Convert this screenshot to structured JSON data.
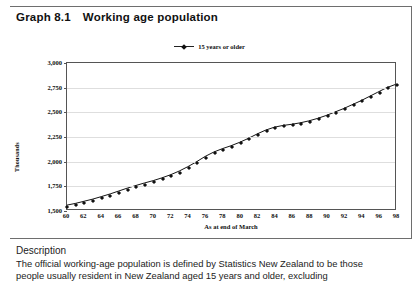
{
  "document": {
    "title_number": "Graph 8.1",
    "title_text": "Working age population"
  },
  "legend": {
    "series_label": "15 years or older",
    "marker_icon": "line-marker-icon"
  },
  "axes": {
    "ylabel": "Thousands",
    "xlabel": "As at end of March"
  },
  "description": {
    "heading": "Description",
    "line1": "The official working-age population is defined by Statistics New Zealand to be those",
    "line2": "people usually resident in New Zealand aged 15 years and older, excluding"
  },
  "colors": {
    "line": "#111111",
    "grid": "#dedede",
    "frame": "#555555",
    "rule": "#6e6e6e",
    "text": "#1a1a1a"
  },
  "chart_data": {
    "type": "line",
    "title": "Working age population",
    "xlabel": "As at end of March",
    "ylabel": "Thousands",
    "ylim": [
      1500,
      3000
    ],
    "yticks": [
      "1,500",
      "1,750",
      "2,000",
      "2,250",
      "2,500",
      "2,750",
      "3,000"
    ],
    "ytick_values": [
      1500,
      1750,
      2000,
      2250,
      2500,
      2750,
      3000
    ],
    "xlim": [
      60,
      98
    ],
    "xticks": [
      "60",
      "62",
      "64",
      "66",
      "68",
      "70",
      "72",
      "74",
      "76",
      "78",
      "80",
      "82",
      "84",
      "86",
      "88",
      "90",
      "92",
      "94",
      "96",
      "98"
    ],
    "xtick_values": [
      60,
      62,
      64,
      66,
      68,
      70,
      72,
      74,
      76,
      78,
      80,
      82,
      84,
      86,
      88,
      90,
      92,
      94,
      96,
      98
    ],
    "grid": true,
    "legend_position": "top-center",
    "series": [
      {
        "name": "15 years or older",
        "x": [
          60,
          61,
          62,
          63,
          64,
          65,
          66,
          67,
          68,
          69,
          70,
          71,
          72,
          73,
          74,
          75,
          76,
          77,
          78,
          79,
          80,
          81,
          82,
          83,
          84,
          85,
          86,
          87,
          88,
          89,
          90,
          91,
          92,
          93,
          94,
          95,
          96,
          97,
          98
        ],
        "values": [
          1540,
          1558,
          1580,
          1602,
          1628,
          1655,
          1685,
          1715,
          1742,
          1768,
          1792,
          1820,
          1852,
          1890,
          1935,
          1985,
          2040,
          2085,
          2120,
          2150,
          2185,
          2225,
          2270,
          2310,
          2340,
          2358,
          2370,
          2385,
          2405,
          2430,
          2460,
          2495,
          2530,
          2570,
          2610,
          2655,
          2700,
          2745,
          2778
        ]
      }
    ]
  }
}
